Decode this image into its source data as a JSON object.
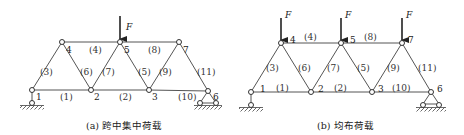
{
  "figures": [
    {
      "id": "a",
      "caption": "(a) 跨中集中荷载",
      "force_label": "F",
      "nodes": [
        {
          "id": "1",
          "x": 32,
          "y": 90
        },
        {
          "id": "2",
          "x": 91,
          "y": 90
        },
        {
          "id": "3",
          "x": 149,
          "y": 90
        },
        {
          "id": "4",
          "x": 62,
          "y": 42
        },
        {
          "id": "5",
          "x": 120,
          "y": 42
        },
        {
          "id": "6",
          "x": 208,
          "y": 91
        },
        {
          "id": "7",
          "x": 179,
          "y": 42
        }
      ],
      "members": [
        {
          "id": "(1)",
          "from": "1",
          "to": "2"
        },
        {
          "id": "(2)",
          "from": "2",
          "to": "3"
        },
        {
          "id": "(3)",
          "from": "1",
          "to": "4"
        },
        {
          "id": "(4)",
          "from": "4",
          "to": "5"
        },
        {
          "id": "(5)",
          "from": "5",
          "to": "3"
        },
        {
          "id": "(6)",
          "from": "4",
          "to": "2"
        },
        {
          "id": "(7)",
          "from": "2",
          "to": "5"
        },
        {
          "id": "(8)",
          "from": "5",
          "to": "7"
        },
        {
          "id": "(9)",
          "from": "3",
          "to": "7"
        },
        {
          "id": "(10)",
          "from": "3",
          "to": "6"
        },
        {
          "id": "(11)",
          "from": "7",
          "to": "6"
        }
      ],
      "loads": [
        {
          "node": "5",
          "label": "F"
        }
      ]
    },
    {
      "id": "b",
      "caption": "(b) 均布荷载",
      "force_label": "F",
      "nodes": [
        {
          "id": "1",
          "x": 251,
          "y": 92
        },
        {
          "id": "2",
          "x": 311,
          "y": 92
        },
        {
          "id": "3",
          "x": 372,
          "y": 92
        },
        {
          "id": "4",
          "x": 281,
          "y": 43
        },
        {
          "id": "5",
          "x": 341,
          "y": 43
        },
        {
          "id": "6",
          "x": 431,
          "y": 92
        },
        {
          "id": "7",
          "x": 402,
          "y": 43
        }
      ],
      "members": [
        {
          "id": "(1)",
          "from": "1",
          "to": "2"
        },
        {
          "id": "(2)",
          "from": "2",
          "to": "3"
        },
        {
          "id": "(3)",
          "from": "1",
          "to": "4"
        },
        {
          "id": "(4)",
          "from": "4",
          "to": "5"
        },
        {
          "id": "(5)",
          "from": "5",
          "to": "3"
        },
        {
          "id": "(6)",
          "from": "4",
          "to": "2"
        },
        {
          "id": "(7)",
          "from": "2",
          "to": "5"
        },
        {
          "id": "(8)",
          "from": "5",
          "to": "7"
        },
        {
          "id": "(9)",
          "from": "3",
          "to": "7"
        },
        {
          "id": "(10)",
          "from": "3",
          "to": "6"
        },
        {
          "id": "(11)",
          "from": "7",
          "to": "6"
        }
      ],
      "loads": [
        {
          "node": "4",
          "label": "F"
        },
        {
          "node": "5",
          "label": "F"
        },
        {
          "node": "7",
          "label": "F"
        }
      ]
    }
  ],
  "labels_a": {
    "n1": "1",
    "n2": "2",
    "n3": "3",
    "n4": "4",
    "n5": "5",
    "n6": "6",
    "n7": "7",
    "m1": "(1)",
    "m2": "(2)",
    "m3": "(3)",
    "m4": "(4)",
    "m5": "(5)",
    "m6": "(6)",
    "m7": "(7)",
    "m8": "(8)",
    "m9": "(9)",
    "m10": "(10)",
    "m11": "(11)",
    "F": "F",
    "caption": "(a) 跨中集中荷载"
  },
  "labels_b": {
    "n1": "1",
    "n2": "2",
    "n3": "3",
    "n4": "4",
    "n5": "5",
    "n6": "6",
    "n7": "7",
    "m1": "(1)",
    "m2": "(2)",
    "m3": "(3)",
    "m4": "(4)",
    "m5": "(5)",
    "m6": "(6)",
    "m7": "(7)",
    "m8": "(8)",
    "m9": "(9)",
    "m10": "(10)",
    "m11": "(11)",
    "F": "F",
    "caption": "(b) 均布荷载"
  }
}
